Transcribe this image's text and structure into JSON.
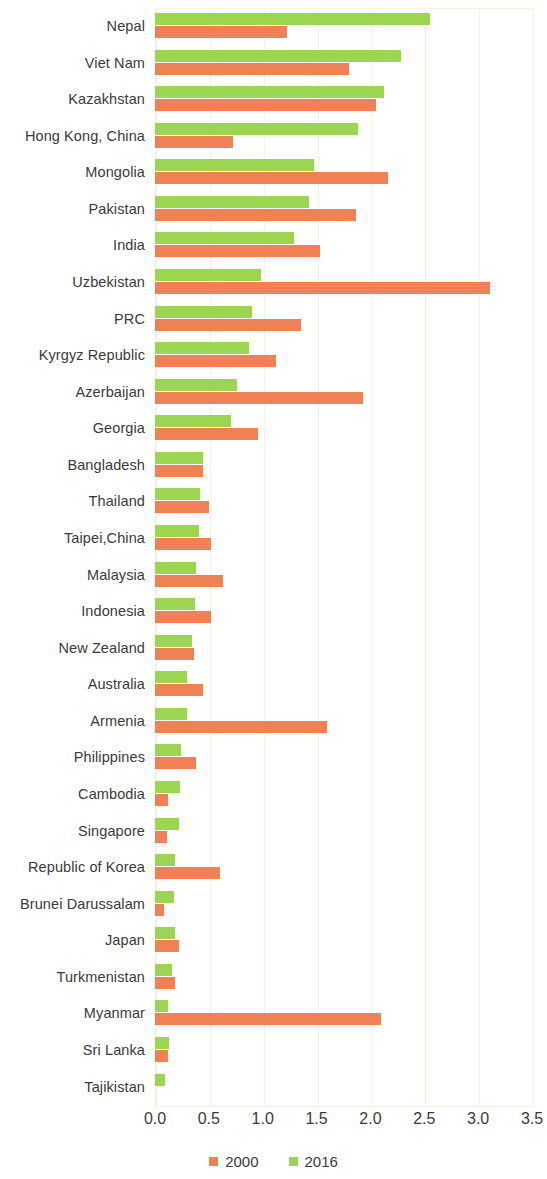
{
  "chart_data": {
    "type": "bar",
    "orientation": "horizontal",
    "title": "",
    "subtitle": "",
    "xlabel": "",
    "ylabel": "",
    "xlim": [
      0.0,
      3.5
    ],
    "xticks": [
      "0.0",
      "0.5",
      "1.0",
      "1.5",
      "2.0",
      "2.5",
      "3.0",
      "3.5"
    ],
    "xtick_values": [
      0.0,
      0.5,
      1.0,
      1.5,
      2.0,
      2.5,
      3.0,
      3.5
    ],
    "grid": true,
    "legend_position": "bottom",
    "categories": [
      "Nepal",
      "Viet Nam",
      "Kazakhstan",
      "Hong Kong, China",
      "Mongolia",
      "Pakistan",
      "India",
      "Uzbekistan",
      "PRC",
      "Kyrgyz Republic",
      "Azerbaijan",
      "Georgia",
      "Bangladesh",
      "Thailand",
      "Taipei,China",
      "Malaysia",
      "Indonesia",
      "New Zealand",
      "Australia",
      "Armenia",
      "Philippines",
      "Cambodia",
      "Singapore",
      "Republic of Korea",
      "Brunei Darussalam",
      "Japan",
      "Turkmenistan",
      "Myanmar",
      "Sri Lanka",
      "Tajikistan"
    ],
    "series": [
      {
        "name": "2000",
        "color": "#EF8155",
        "values": [
          1.23,
          1.8,
          2.05,
          0.72,
          2.16,
          1.87,
          1.53,
          3.11,
          1.36,
          1.12,
          1.93,
          0.96,
          0.45,
          0.5,
          0.52,
          0.63,
          0.52,
          0.36,
          0.45,
          1.6,
          0.38,
          0.12,
          0.11,
          0.6,
          0.08,
          0.22,
          0.19,
          2.1,
          0.12,
          0.0
        ]
      },
      {
        "name": "2016",
        "color": "#9BD552",
        "values": [
          2.55,
          2.28,
          2.13,
          1.88,
          1.48,
          1.43,
          1.29,
          0.98,
          0.9,
          0.87,
          0.76,
          0.71,
          0.45,
          0.42,
          0.41,
          0.38,
          0.37,
          0.34,
          0.3,
          0.3,
          0.24,
          0.23,
          0.22,
          0.19,
          0.18,
          0.19,
          0.16,
          0.12,
          0.13,
          0.09
        ]
      }
    ]
  },
  "legend": {
    "items": [
      {
        "label": "2000",
        "color": "#EF8155"
      },
      {
        "label": "2016",
        "color": "#9BD552"
      }
    ]
  }
}
